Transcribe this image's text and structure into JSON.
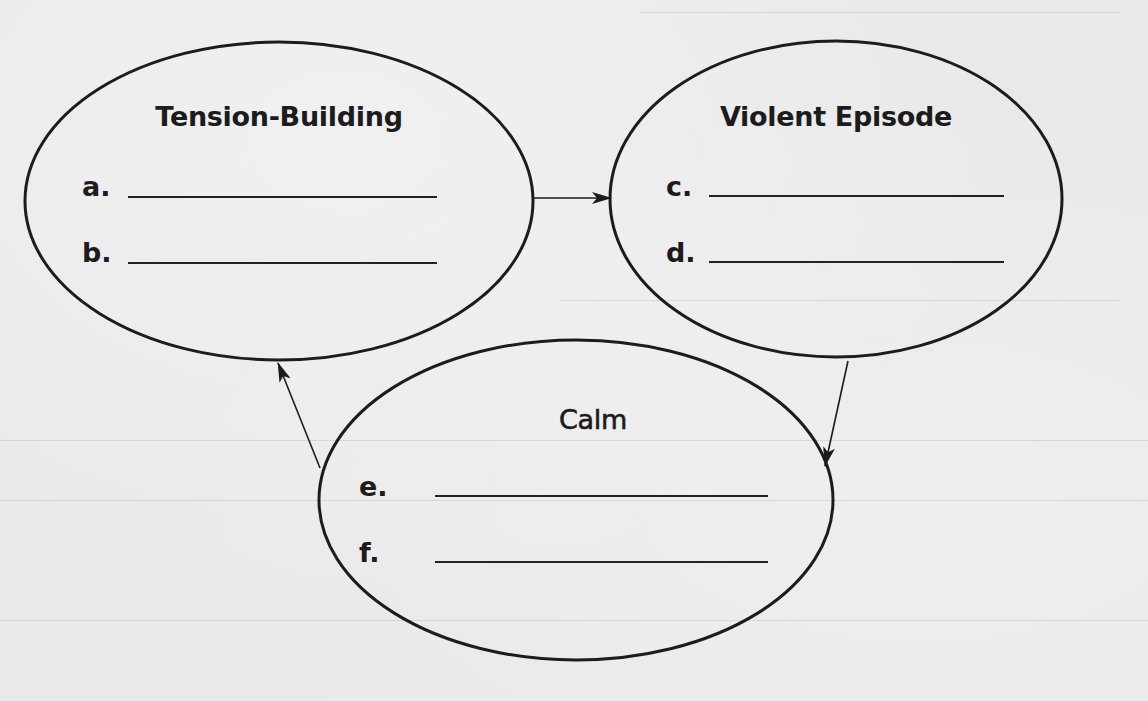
{
  "diagram": {
    "stages": [
      {
        "id": "tension-building",
        "title": "Tension-Building",
        "items": [
          {
            "label": "a.",
            "value": ""
          },
          {
            "label": "b.",
            "value": ""
          }
        ]
      },
      {
        "id": "violent-episode",
        "title": "Violent Episode",
        "items": [
          {
            "label": "c.",
            "value": ""
          },
          {
            "label": "d.",
            "value": ""
          }
        ]
      },
      {
        "id": "calm",
        "title": "Calm",
        "items": [
          {
            "label": "e.",
            "value": ""
          },
          {
            "label": "f.",
            "value": ""
          }
        ]
      }
    ],
    "edges": [
      {
        "from": "tension-building",
        "to": "violent-episode"
      },
      {
        "from": "violent-episode",
        "to": "calm"
      },
      {
        "from": "calm",
        "to": "tension-building"
      }
    ],
    "colors": {
      "ink": "#1c1c1c",
      "paper": "#e9e9e9"
    }
  }
}
